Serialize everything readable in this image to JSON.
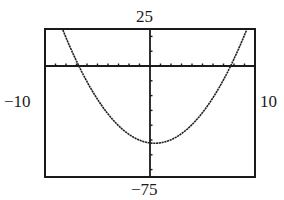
{
  "chart_data": {
    "type": "line",
    "title": "",
    "xlabel": "",
    "ylabel": "",
    "xlim": [
      -10,
      10
    ],
    "ylim": [
      -75,
      25
    ],
    "window_labels": {
      "ymax": "25",
      "ymin": "−75",
      "xmin": "−10",
      "xmax": "10"
    },
    "x_tick_step": 1,
    "y_tick_step": 10,
    "grid": false,
    "series": [
      {
        "name": "parabola",
        "equation_estimate": "y = x^2 - 0.9x - 52",
        "vertex": [
          0.45,
          -52
        ],
        "x_intercepts": [
          -6.8,
          7.7
        ],
        "x": [
          -8.4,
          -8,
          -7,
          -6.8,
          -6,
          -5,
          -4,
          -3,
          -2,
          -1,
          0,
          0.45,
          1,
          2,
          3,
          4,
          5,
          6,
          7,
          7.7,
          8,
          9
        ],
        "y": [
          25.1,
          19.2,
          3.3,
          0,
          -10.6,
          -22.5,
          -32.4,
          -40.3,
          -46.2,
          -50.1,
          -52,
          -52.2,
          -51.9,
          -49.8,
          -45.7,
          -39.6,
          -31.5,
          -21.4,
          -9.3,
          0,
          4.8,
          20.9
        ]
      }
    ]
  }
}
